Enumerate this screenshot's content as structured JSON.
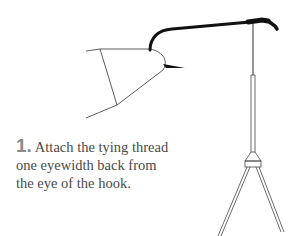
{
  "step": {
    "number": "1.",
    "text_lines": [
      "Attach the tying thread",
      "one eyewidth back from",
      "the eye of the hook."
    ]
  },
  "illustration": {
    "subject": "hook-in-vise-with-bobbin-illustration",
    "line_color": "#222222",
    "hook_color": "#111111"
  }
}
